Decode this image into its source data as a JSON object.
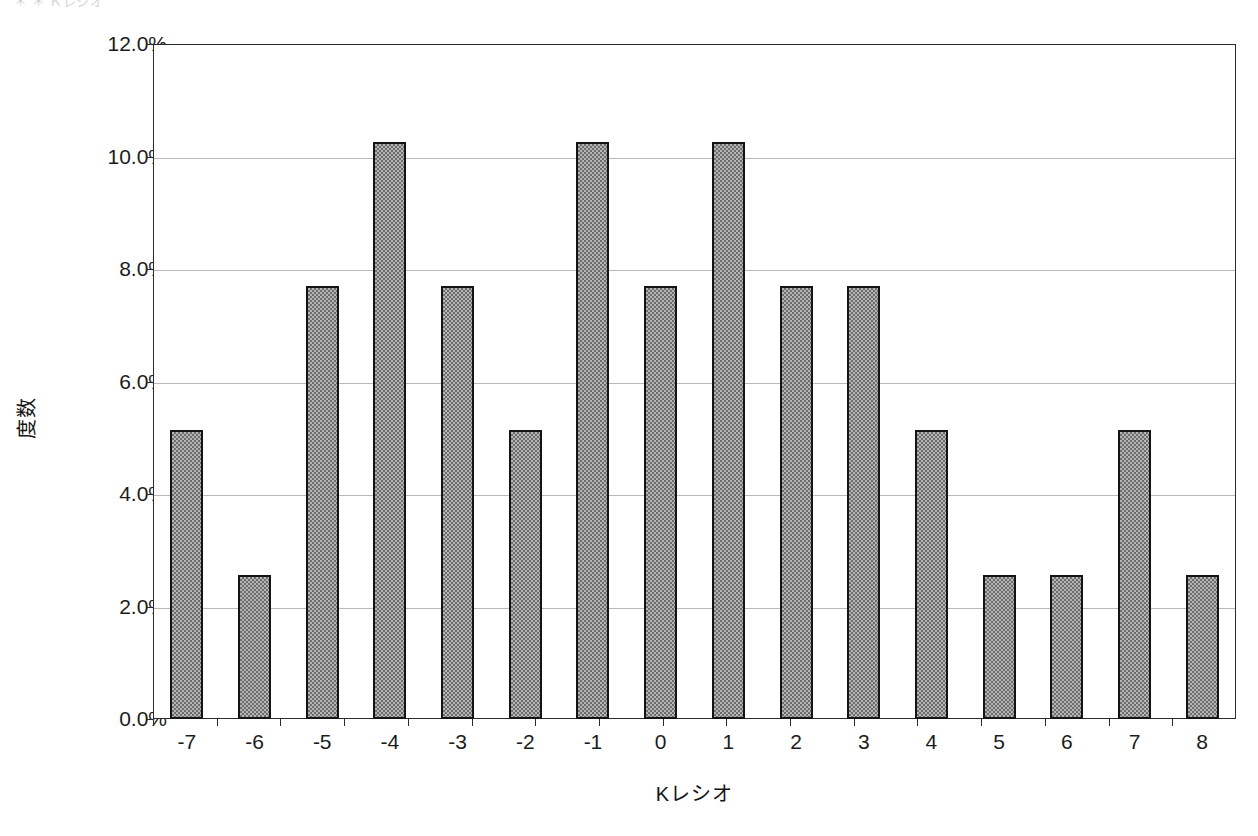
{
  "header": {
    "clipped_text": "＊  ＊  Ｋレシオ"
  },
  "chart_data": {
    "type": "bar",
    "title": "",
    "subtitle": "",
    "xlabel": "Kレシオ",
    "ylabel": "度数",
    "categories": [
      "-7",
      "-6",
      "-5",
      "-4",
      "-3",
      "-2",
      "-1",
      "0",
      "1",
      "2",
      "3",
      "4",
      "5",
      "6",
      "7",
      "8"
    ],
    "values": [
      5.13,
      2.56,
      7.69,
      10.26,
      7.69,
      5.13,
      10.26,
      7.69,
      10.26,
      7.69,
      7.69,
      5.13,
      2.56,
      2.56,
      5.13,
      2.56
    ],
    "value_labels": [
      "5.13%",
      "2.56%",
      "7.69%",
      "10.26%",
      "7.69%",
      "5.13%",
      "10.26%",
      "7.69%",
      "10.26%",
      "7.69%",
      "7.69%",
      "5.13%",
      "2.56%",
      "2.56%",
      "5.13%",
      "2.56%"
    ],
    "ylim": [
      0,
      12
    ],
    "ytick_values": [
      0,
      2,
      4,
      6,
      8,
      10,
      12
    ],
    "ytick_labels": [
      "0.0%",
      "2.0%",
      "4.0%",
      "6.0%",
      "8.0%",
      "10.0%",
      "12.0%"
    ],
    "grid": true,
    "grid_axis": "y",
    "legend": false,
    "legend_position": "none",
    "series": [
      {
        "name": "度数",
        "values": [
          5.13,
          2.56,
          7.69,
          10.26,
          7.69,
          5.13,
          10.26,
          7.69,
          10.26,
          7.69,
          7.69,
          5.13,
          2.56,
          2.56,
          5.13,
          2.56
        ]
      }
    ],
    "colors": {
      "bar_fill": "#b5b5b5",
      "bar_pattern": "#6d6d6d",
      "bar_border": "#141414",
      "gridline": "#b9b9b9",
      "axis": "#2b2b2b",
      "background": "#ffffff",
      "text": "#1c1c1c"
    }
  }
}
